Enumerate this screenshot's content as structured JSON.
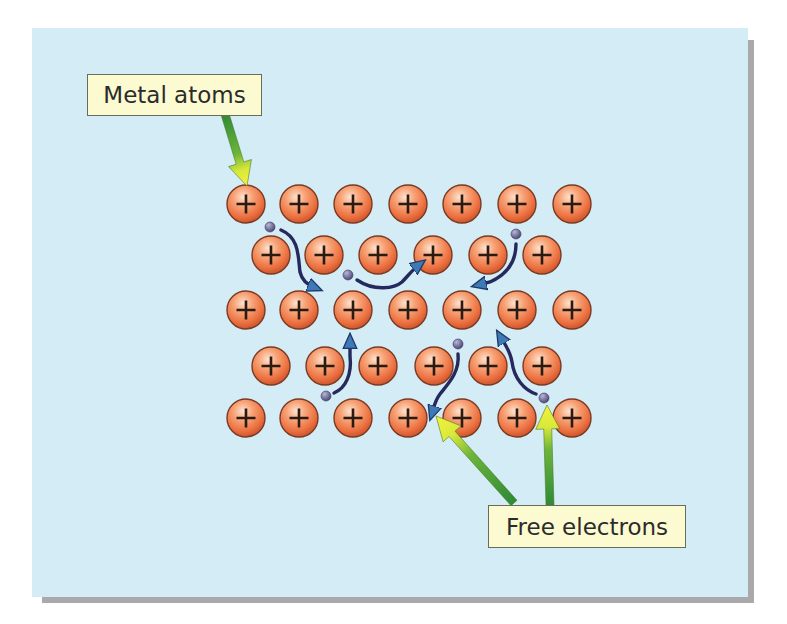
{
  "labels": {
    "metal_atoms": "Metal atoms",
    "free_electrons": "Free electrons"
  },
  "atom_symbol": "+",
  "colors": {
    "background": "#d4ecf5",
    "atom_fill": "#ef7a4a",
    "atom_highlight": "#fbc9a8",
    "atom_stroke": "#7a3a22",
    "electron": "#5b5880",
    "path": "#242a5e",
    "path_head": "#3f7ab8",
    "label_fill": "#fcfad0",
    "arrow_dark": "#2e8a36",
    "arrow_light": "#f4f23a"
  },
  "lattice": {
    "rows": [
      {
        "y": 204,
        "x": [
          246,
          299,
          353,
          408,
          462,
          517,
          572
        ]
      },
      {
        "y": 255,
        "x": [
          271,
          324,
          378,
          433,
          488,
          542
        ]
      },
      {
        "y": 310,
        "x": [
          246,
          299,
          353,
          408,
          462,
          517,
          572
        ]
      },
      {
        "y": 366,
        "x": [
          271,
          325,
          378,
          434,
          488,
          542
        ]
      },
      {
        "y": 418,
        "x": [
          246,
          299,
          353,
          408,
          462,
          517,
          572
        ]
      }
    ],
    "radius": 19
  },
  "electrons": [
    {
      "x": 270,
      "y": 227,
      "path": "M 281 230 C 300 238, 298 258, 300 272 C 302 280, 306 284, 316 288"
    },
    {
      "x": 348,
      "y": 275,
      "path": "M 357 280 C 375 292, 395 288, 402 282 C 408 276, 412 270, 420 264"
    },
    {
      "x": 516,
      "y": 234,
      "path": "M 516 244 C 516 262, 508 274, 490 282 L 478 285"
    },
    {
      "x": 326,
      "y": 396,
      "path": "M 334 393 C 346 388, 352 374, 350 356 L 350 340"
    },
    {
      "x": 458,
      "y": 344,
      "path": "M 458 354 C 460 372, 448 384, 440 394 C 434 402, 434 408, 432 414"
    },
    {
      "x": 544,
      "y": 398,
      "path": "M 536 394 C 524 390, 514 378, 512 362 C 510 350, 504 343, 500 336"
    }
  ],
  "pointer_arrows": [
    {
      "target": "metal_atoms",
      "from": [
        225,
        114
      ],
      "to": [
        247,
        186
      ]
    },
    {
      "target": "free_electrons",
      "from": [
        514,
        503
      ],
      "to": [
        436,
        416
      ]
    },
    {
      "target": "free_electrons",
      "from": [
        550,
        505
      ],
      "to": [
        547,
        405
      ]
    }
  ]
}
